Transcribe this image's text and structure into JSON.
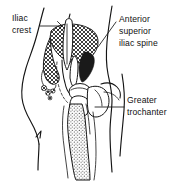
{
  "figure": {
    "name": "hip-pelvis-anatomy-diagram",
    "background_color": "#ffffff",
    "ink_color": "#141414",
    "width": 194,
    "height": 184
  },
  "labels": [
    {
      "id": "iliac-crest",
      "lines": [
        "Iliac",
        "crest"
      ],
      "line1": "Iliac",
      "line2": "crest",
      "position": "top-left",
      "text_x": 12,
      "text_y": 22,
      "leader_path": "M 42 26 L 63 26 M 63 26 L 59 21 M 63 26 L 59 31"
    },
    {
      "id": "anterior-superior-iliac-spine",
      "lines": [
        "Anterior",
        "superior",
        "iliac spine"
      ],
      "line1": "Anterior",
      "line2": "superior",
      "line3": "iliac spine",
      "position": "top-right",
      "text_x": 119,
      "text_y": 21,
      "leader_path": "M 117 22 L 99 46"
    },
    {
      "id": "greater-trochanter",
      "lines": [
        "Greater",
        "trochanter"
      ],
      "line1": "Greater",
      "line2": "trochanter",
      "position": "right",
      "text_x": 127,
      "text_y": 104,
      "leader_path": "M 125 107 L 96 107"
    }
  ],
  "anatomy_parts": [
    {
      "id": "body-contour-left",
      "name": "left torso and thigh contour"
    },
    {
      "id": "body-contour-right",
      "name": "right torso and thigh contour"
    },
    {
      "id": "ilium-crosshatch",
      "name": "ilium with cross-hatch shading"
    },
    {
      "id": "pelvic-dark-region",
      "name": "shaded pelvic notch region"
    },
    {
      "id": "femoral-head",
      "name": "femoral head"
    },
    {
      "id": "greater-trochanter-shape",
      "name": "greater trochanter prominence"
    },
    {
      "id": "femur-shaft",
      "name": "stippled femur shaft"
    },
    {
      "id": "pubic-ramus",
      "name": "pubic ramus outline"
    }
  ],
  "textures": {
    "crosshatch": "diagonal cross-hatch fill on ilium",
    "stipple": "dotted stipple fill on femur shaft",
    "solid_dark": "solid dark fill on pelvic notch"
  }
}
